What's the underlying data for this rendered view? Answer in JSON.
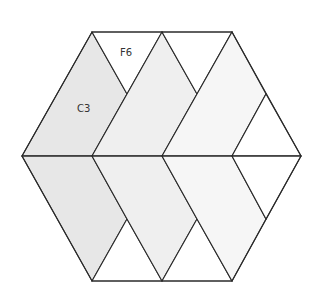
{
  "diagram": {
    "title": "",
    "labels": [
      {
        "id": "F6",
        "text": "F6",
        "x": 120,
        "y": 56
      },
      {
        "id": "C3",
        "text": "C3",
        "x": 77,
        "y": 112
      }
    ],
    "colors": {
      "stroke": "#2a2a2a",
      "shade_dark": "#e7e7e7",
      "shade_mid": "#efefef",
      "shade_light": "#f6f6f6",
      "white": "#ffffff"
    },
    "regions": [
      {
        "name": "upper-left-rhombus",
        "fill": "shade_dark",
        "points": "22,156 92,32 127,94 92,156"
      },
      {
        "name": "upper-f6-triangle",
        "fill": "white",
        "points": "92,32 162,32 127,94"
      },
      {
        "name": "upper-middle-parallelogram",
        "fill": "shade_mid",
        "points": "92,156 127,94 162,32 197,94 162,156"
      },
      {
        "name": "upper-middle-triangle",
        "fill": "white",
        "points": "162,32 232,32 197,94"
      },
      {
        "name": "upper-right-parallelogram",
        "fill": "shade_light",
        "points": "162,156 197,94 232,32 266,94 232,156"
      },
      {
        "name": "upper-right-triangle",
        "fill": "white",
        "points": "232,156 266,94 301,156"
      },
      {
        "name": "lower-left-rhombus",
        "fill": "shade_dark",
        "points": "22,156 92,156 127,219 92,281"
      },
      {
        "name": "lower-left-triangle",
        "fill": "white",
        "points": "92,281 127,219 162,281"
      },
      {
        "name": "lower-middle-parallelogram",
        "fill": "shade_mid",
        "points": "92,156 162,156 197,219 162,281 127,219"
      },
      {
        "name": "lower-middle-triangle",
        "fill": "white",
        "points": "162,281 197,219 232,281"
      },
      {
        "name": "lower-right-parallelogram",
        "fill": "shade_light",
        "points": "162,156 232,156 266,219 232,281 197,219"
      },
      {
        "name": "lower-right-triangle",
        "fill": "white",
        "points": "232,156 301,156 266,219"
      }
    ]
  }
}
